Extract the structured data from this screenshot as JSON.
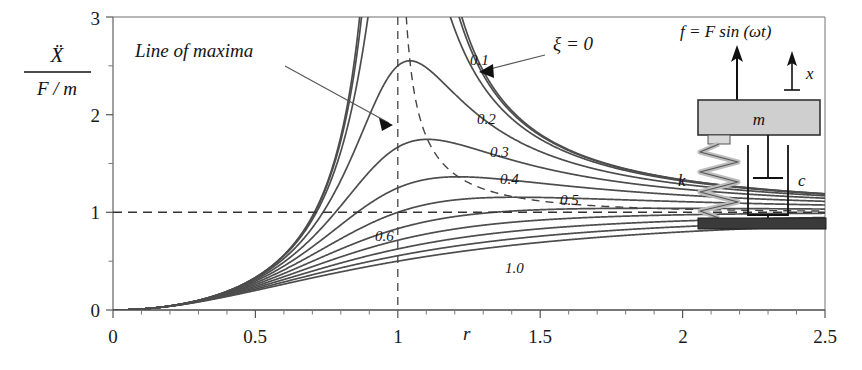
{
  "figure": {
    "annotation_line_of_maxima": "Line of maxima",
    "zeta_zero_label": "ξ = 0"
  },
  "axes": {
    "x_axis_label": "r",
    "y_axis_numerator": "Ẍ",
    "y_axis_denominator": "F / m",
    "x_ticks": [
      "0",
      "0.5",
      "1",
      "1.5",
      "2",
      "2.5"
    ],
    "y_ticks": [
      "0",
      "1",
      "2",
      "3"
    ]
  },
  "schematic": {
    "force_label": "f = F sin (ωt)",
    "mass_label": "m",
    "spring_label": "k",
    "damper_label": "c",
    "displacement_label": "x"
  },
  "chart_data": {
    "type": "line",
    "title": "",
    "xlabel": "r",
    "ylabel": "Xdd / (F/m)",
    "xlim": [
      0,
      2.5
    ],
    "ylim": [
      0,
      3
    ],
    "grid": false,
    "legend": "inline curve labels",
    "x_ticks": [
      0,
      0.5,
      1,
      1.5,
      2,
      2.5
    ],
    "y_ticks": [
      0,
      1,
      2,
      3
    ],
    "x_minor_tick_step": 0.1,
    "y_minor_tick_step": 0.5,
    "formula": "y = r^2 / sqrt((1-r^2)^2 + (2*zeta*r)^2)",
    "series": [
      {
        "name": "0",
        "zeta": 0.0,
        "label": "ξ = 0",
        "labeled": true,
        "peak_r": 1.0,
        "peak_y": 3.0
      },
      {
        "name": "0.05",
        "zeta": 0.05,
        "label": "",
        "labeled": false,
        "peak_r": 1.0025,
        "peak_y": 10.0
      },
      {
        "name": "0.1",
        "zeta": 0.1,
        "label": "0.1",
        "labeled": true,
        "peak_r": 1.0102,
        "peak_y": 5.025
      },
      {
        "name": "0.2",
        "zeta": 0.2,
        "label": "0.2",
        "labeled": true,
        "peak_r": 1.0426,
        "peak_y": 2.551
      },
      {
        "name": "0.3",
        "zeta": 0.3,
        "label": "0.3",
        "labeled": true,
        "peak_r": 1.0483,
        "peak_y": 1.747
      },
      {
        "name": "0.4",
        "zeta": 0.4,
        "label": "0.4",
        "labeled": true,
        "peak_r": 1.0911,
        "peak_y": 1.364
      },
      {
        "name": "0.5",
        "zeta": 0.5,
        "label": "0.5",
        "labeled": true,
        "peak_r": 1.4142,
        "peak_y": 1.155
      },
      {
        "name": "0.6",
        "zeta": 0.6,
        "label": "0.6",
        "labeled": true,
        "peak_r": 2.5,
        "peak_y": 1.06
      },
      {
        "name": "0.7",
        "zeta": 0.7,
        "label": "",
        "labeled": false,
        "peak_r": 2.5,
        "peak_y": 1.02
      },
      {
        "name": "0.8",
        "zeta": 0.8,
        "label": "",
        "labeled": false,
        "peak_r": 2.5,
        "peak_y": 0.98
      },
      {
        "name": "0.9",
        "zeta": 0.9,
        "label": "",
        "labeled": false,
        "peak_r": 2.5,
        "peak_y": 0.94
      },
      {
        "name": "1.0",
        "zeta": 1.0,
        "label": "1.0",
        "labeled": true,
        "peak_r": 2.5,
        "peak_y": 0.9
      }
    ],
    "reference_lines": [
      {
        "name": "unity-asymptote",
        "orientation": "horizontal",
        "value": 1,
        "style": "dashed"
      },
      {
        "name": "resonance",
        "orientation": "vertical",
        "value": 1,
        "style": "dashed"
      }
    ],
    "line_of_maxima": {
      "style": "dashed",
      "description": "locus of curve peaks, r = 1/sqrt(1-2*zeta^2), y = 1/(2*zeta*sqrt(1-zeta^2))"
    }
  }
}
